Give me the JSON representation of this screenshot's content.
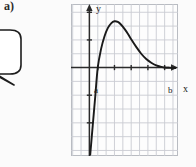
{
  "figure": {
    "part_label": "a)",
    "callout": {
      "text": ".",
      "shape": "speech-bubble"
    },
    "axis_labels": {
      "x": "x",
      "y": "y"
    },
    "point_labels": {
      "a": "a",
      "b": "b"
    },
    "colors": {
      "grid": "#c9ccd2",
      "frame": "#b9bcc2",
      "axis": "#2b2b2b",
      "curve": "#1a1a1a",
      "background": "#fdfdfd",
      "page": "#fbfbfb"
    }
  },
  "chart_data": {
    "type": "line",
    "title": "",
    "xlabel": "x",
    "ylabel": "y",
    "grid": true,
    "legend": false,
    "xlim": [
      -2.2,
      10.6
    ],
    "ylim": [
      -6.4,
      4.6
    ],
    "annotations": [
      {
        "text": "a",
        "x": 1.0,
        "y": 0,
        "note": "left x-intercept of the curve"
      },
      {
        "text": "b",
        "x": 9.0,
        "y": 0,
        "note": "right x-intercept of the curve"
      }
    ],
    "xticks": [
      1,
      3,
      5,
      7,
      9
    ],
    "yticks": [
      -4,
      -2,
      2,
      4
    ],
    "series": [
      {
        "name": "f(x)",
        "x": [
          0.1,
          0.4,
          0.7,
          1.0,
          1.4,
          1.8,
          2.2,
          2.6,
          3.0,
          3.4,
          3.8,
          4.2,
          4.6,
          5.0,
          5.6,
          6.2,
          6.8,
          7.4,
          8.0,
          8.6,
          9.0,
          9.6,
          10.3
        ],
        "values": [
          -6.3,
          -4.2,
          -2.1,
          0.0,
          1.35,
          2.25,
          2.85,
          3.2,
          3.35,
          3.3,
          3.1,
          2.8,
          2.45,
          2.05,
          1.5,
          1.0,
          0.62,
          0.35,
          0.16,
          0.05,
          0.0,
          -0.02,
          -0.03
        ]
      }
    ]
  }
}
